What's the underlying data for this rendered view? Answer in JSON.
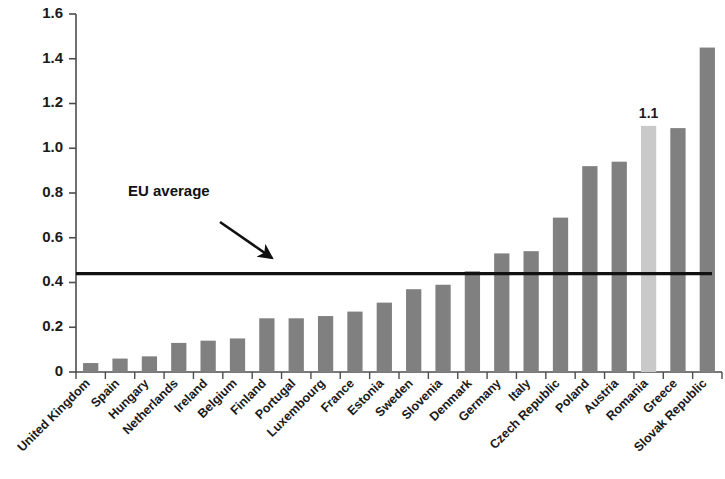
{
  "chart_data": {
    "type": "bar",
    "title": "",
    "subtitle": "",
    "xlabel": "",
    "ylabel": "",
    "ylim": [
      0,
      1.6
    ],
    "ytick_labels": [
      "1.6",
      "1.4",
      "1.2",
      "1.0",
      "0.8",
      "0.6",
      "0.4",
      "0.2",
      "0"
    ],
    "ytick_values": [
      1.6,
      1.4,
      1.2,
      1.0,
      0.8,
      0.6,
      0.4,
      0.2,
      0
    ],
    "grid": false,
    "legend": "none",
    "categories": [
      "United Kingdom",
      "Spain",
      "Hungary",
      "Netherlands",
      "Ireland",
      "Belgium",
      "Finland",
      "Portugal",
      "Luxembourg",
      "France",
      "Estonia",
      "Sweden",
      "Slovenia",
      "Denmark",
      "Germany",
      "Italy",
      "Czech Republic",
      "Poland",
      "Austria",
      "Romania",
      "Greece",
      "Slovak Republic"
    ],
    "values": [
      0.04,
      0.06,
      0.07,
      0.13,
      0.14,
      0.15,
      0.24,
      0.24,
      0.25,
      0.27,
      0.31,
      0.37,
      0.39,
      0.45,
      0.53,
      0.54,
      0.69,
      0.92,
      0.94,
      1.1,
      1.09,
      1.45
    ],
    "highlight_index": 19,
    "data_labels": {
      "19": "1.1"
    },
    "reference_line": {
      "label": "EU average",
      "value": 0.44
    },
    "colors": {
      "bar": "#808080",
      "bar_highlight": "#c9c9c9",
      "reference_line": "#111111",
      "axis": "#4d4d4d",
      "text": "#1a1a1a",
      "background": "#ffffff"
    }
  }
}
